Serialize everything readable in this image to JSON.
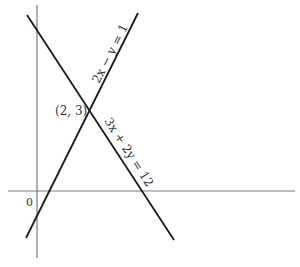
{
  "diagram": {
    "type": "linear-system-graph",
    "axes": {
      "origin_label": "0",
      "x_axis": {
        "x1": 8,
        "y1": 191,
        "x2": 295,
        "y2": 191
      },
      "y_axis": {
        "x1": 37,
        "y1": 5,
        "x2": 37,
        "y2": 258
      }
    },
    "lines": [
      {
        "name": "line-3x-plus-2y-eq-12",
        "equation": "3x + 2y = 12",
        "x1": 27,
        "y1": 15,
        "x2": 174,
        "y2": 240
      },
      {
        "name": "line-2x-minus-y-eq-1",
        "equation": "2x − y = 1",
        "x1": 26,
        "y1": 238,
        "x2": 138,
        "y2": 13
      }
    ],
    "intersection": {
      "label": "(2, 3)",
      "x": 2,
      "y": 3
    },
    "colors": {
      "line": "#1a1a1a",
      "axis": "#7a7a7a",
      "text": "#333333",
      "background": "#ffffff"
    }
  }
}
